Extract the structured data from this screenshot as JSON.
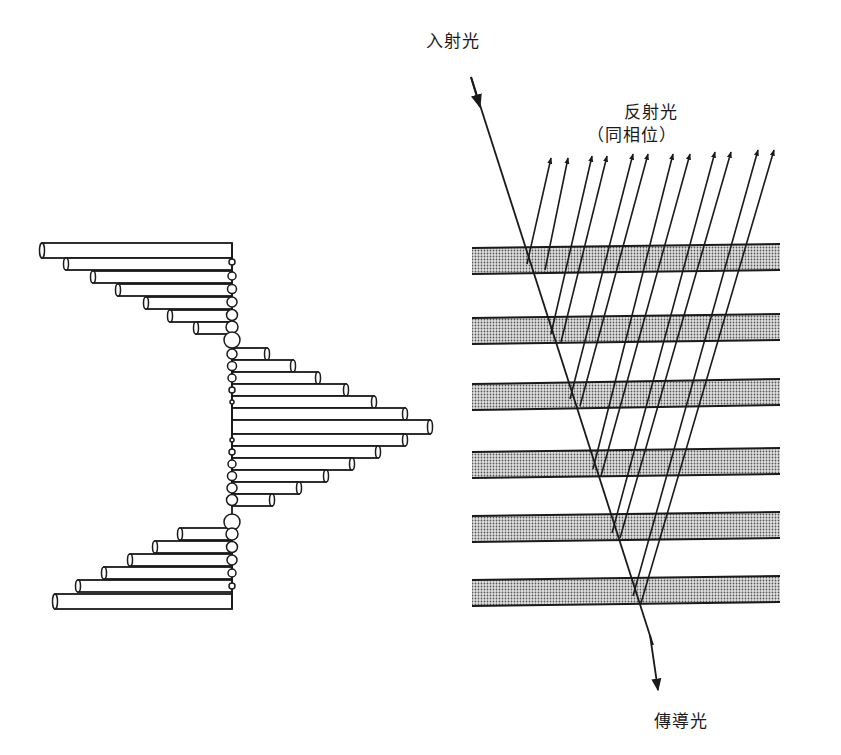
{
  "labels": {
    "incident": "入射光",
    "reflected": "反射光",
    "reflected_sub": "（同相位）",
    "transmitted": "傳導光"
  },
  "colors": {
    "line": "#1a1a1a",
    "band_fill": "#b8b8b8",
    "background": "#ffffff"
  },
  "left_diagram": {
    "axis_x": 232,
    "bar_height": 12,
    "top_group": [
      {
        "y": 243,
        "x_end": 42,
        "h": 15
      },
      {
        "y": 258,
        "x_end": 66
      },
      {
        "y": 271,
        "x_end": 93
      },
      {
        "y": 284,
        "x_end": 118
      },
      {
        "y": 297,
        "x_end": 146
      },
      {
        "y": 310,
        "x_end": 170
      },
      {
        "y": 322,
        "x_end": 196
      }
    ],
    "middle_group": [
      {
        "y": 348,
        "x_end": 267
      },
      {
        "y": 360,
        "x_end": 293
      },
      {
        "y": 372,
        "x_end": 318
      },
      {
        "y": 384,
        "x_end": 346
      },
      {
        "y": 396,
        "x_end": 374
      },
      {
        "y": 408,
        "x_end": 405
      },
      {
        "y": 420,
        "x_end": 430,
        "h": 14
      },
      {
        "y": 434,
        "x_end": 405
      },
      {
        "y": 446,
        "x_end": 378
      },
      {
        "y": 458,
        "x_end": 352
      },
      {
        "y": 470,
        "x_end": 326
      },
      {
        "y": 482,
        "x_end": 299
      },
      {
        "y": 494,
        "x_end": 272
      }
    ],
    "bottom_group": [
      {
        "y": 528,
        "x_end": 180
      },
      {
        "y": 541,
        "x_end": 155
      },
      {
        "y": 554,
        "x_end": 130
      },
      {
        "y": 567,
        "x_end": 104
      },
      {
        "y": 580,
        "x_end": 78
      },
      {
        "y": 594,
        "x_end": 55,
        "h": 15
      }
    ],
    "circles": [
      {
        "cy": 262,
        "r": 3
      },
      {
        "cy": 276,
        "r": 4
      },
      {
        "cy": 289,
        "r": 4.5
      },
      {
        "cy": 302,
        "r": 5
      },
      {
        "cy": 315,
        "r": 5.5
      },
      {
        "cy": 327,
        "r": 6
      },
      {
        "cy": 340,
        "r": 8
      },
      {
        "cy": 354,
        "r": 5
      },
      {
        "cy": 366,
        "r": 4.5
      },
      {
        "cy": 378,
        "r": 4
      },
      {
        "cy": 390,
        "r": 3
      },
      {
        "cy": 402,
        "r": 2
      },
      {
        "cy": 440,
        "r": 2
      },
      {
        "cy": 452,
        "r": 3
      },
      {
        "cy": 464,
        "r": 4
      },
      {
        "cy": 476,
        "r": 4.5
      },
      {
        "cy": 488,
        "r": 5
      },
      {
        "cy": 500,
        "r": 5.5
      },
      {
        "cy": 522,
        "r": 8
      },
      {
        "cy": 534,
        "r": 6
      },
      {
        "cy": 547,
        "r": 5.5
      },
      {
        "cy": 560,
        "r": 5
      },
      {
        "cy": 573,
        "r": 4
      },
      {
        "cy": 586,
        "r": 3
      }
    ]
  },
  "right_diagram": {
    "bands": [
      {
        "y_top_left": 248,
        "y_top_right": 244,
        "thickness": 26
      },
      {
        "y_top_left": 318,
        "y_top_right": 314,
        "thickness": 26
      },
      {
        "y_top_left": 384,
        "y_top_right": 379,
        "thickness": 26
      },
      {
        "y_top_left": 452,
        "y_top_right": 448,
        "thickness": 26
      },
      {
        "y_top_left": 516,
        "y_top_right": 512,
        "thickness": 26
      },
      {
        "y_top_left": 580,
        "y_top_right": 576,
        "thickness": 26
      }
    ],
    "band_x_left": 472,
    "band_x_right": 780,
    "incident_ray": {
      "x1": 471,
      "y1": 77,
      "x2": 658,
      "y2": 660
    },
    "reflected_rays": [
      {
        "x0": 527,
        "y0": 264,
        "x1": 551,
        "y1": 158
      },
      {
        "x0": 545,
        "y0": 270,
        "x1": 568,
        "y1": 158
      },
      {
        "x0": 551,
        "y0": 334,
        "x1": 592,
        "y1": 156
      },
      {
        "x0": 561,
        "y0": 342,
        "x1": 607,
        "y1": 156
      },
      {
        "x0": 570,
        "y0": 399,
        "x1": 633,
        "y1": 154
      },
      {
        "x0": 580,
        "y0": 406,
        "x1": 648,
        "y1": 154
      },
      {
        "x0": 593,
        "y0": 469,
        "x1": 673,
        "y1": 154
      },
      {
        "x0": 601,
        "y0": 476,
        "x1": 690,
        "y1": 154
      },
      {
        "x0": 612,
        "y0": 533,
        "x1": 715,
        "y1": 152
      },
      {
        "x0": 620,
        "y0": 538,
        "x1": 731,
        "y1": 152
      },
      {
        "x0": 633,
        "y0": 596,
        "x1": 758,
        "y1": 150
      },
      {
        "x0": 641,
        "y0": 603,
        "x1": 774,
        "y1": 150
      }
    ]
  }
}
